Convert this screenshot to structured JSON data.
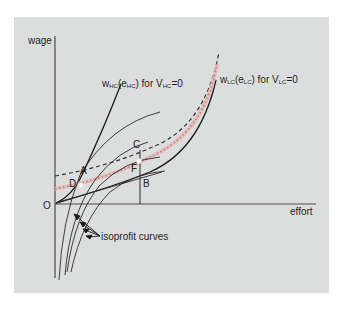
{
  "figure": {
    "background_color": "#dcdedd",
    "axes": {
      "y_label": "wage",
      "x_label": "effort",
      "origin_label": "O"
    },
    "curves": {
      "high_cost": {
        "func": "w",
        "func_sub": "HC",
        "arg": "e",
        "arg_sub": "HC",
        "cond_prefix": "for V",
        "cond_sub": "HC",
        "cond_suffix": "=0"
      },
      "low_cost": {
        "func": "w",
        "func_sub": "LC",
        "arg": "e",
        "arg_sub": "LC",
        "cond_prefix": "for V",
        "cond_sub": "LC",
        "cond_suffix": "=0"
      },
      "pooled_color": "#c9817f",
      "dashed_color": "#2a3440"
    },
    "points": {
      "A": "A",
      "B": "B",
      "C": "C",
      "D": "D",
      "F": "F"
    },
    "annotation": "isoprofit curves"
  }
}
